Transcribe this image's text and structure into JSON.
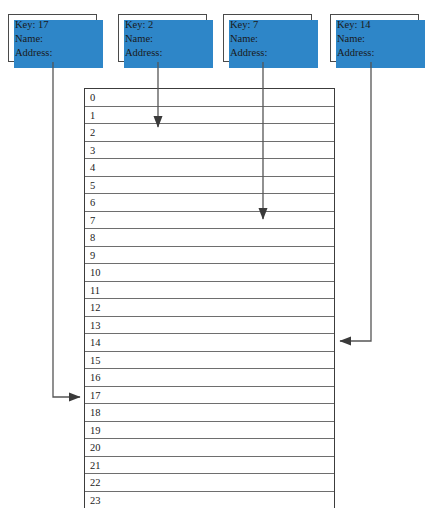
{
  "diagram": {
    "accent_color": "#2e86c8",
    "line_color": "#555555",
    "records": [
      {
        "id": "record-key-17",
        "key_label": "Key: 17",
        "name_label": "Name:",
        "address_label": "Address:",
        "target_slot": "17"
      },
      {
        "id": "record-key-2",
        "key_label": "Key: 2",
        "name_label": "Name:",
        "address_label": "Address:",
        "target_slot": "2"
      },
      {
        "id": "record-key-7",
        "key_label": "Key: 7",
        "name_label": "Name:",
        "address_label": "Address:",
        "target_slot": "7"
      },
      {
        "id": "record-key-14",
        "key_label": "Key: 14",
        "name_label": "Name:",
        "address_label": "Address:",
        "target_slot": "14"
      }
    ],
    "table": {
      "slots": [
        "0",
        "1",
        "2",
        "3",
        "4",
        "5",
        "6",
        "7",
        "8",
        "9",
        "10",
        "11",
        "12",
        "13",
        "14",
        "15",
        "16",
        "17",
        "18",
        "19",
        "20",
        "21",
        "22",
        "23"
      ]
    }
  }
}
